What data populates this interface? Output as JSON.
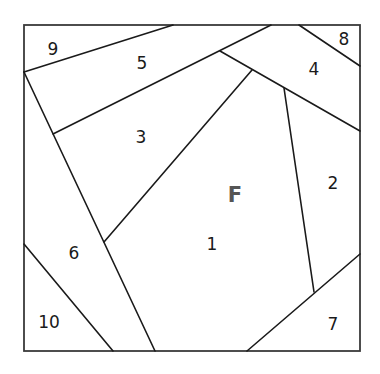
{
  "diagram": {
    "type": "foundation-paper-piecing-pattern",
    "face_label": "F",
    "colors": {
      "line": "#1a1a1a",
      "frame": "#3a3a3a",
      "face_label": "#555555",
      "background": "#ffffff"
    },
    "regions": [
      {
        "id": "1",
        "label": "1",
        "x": 212,
        "y": 251
      },
      {
        "id": "2",
        "label": "2",
        "x": 333,
        "y": 190
      },
      {
        "id": "3",
        "label": "3",
        "x": 141,
        "y": 143
      },
      {
        "id": "4",
        "label": "4",
        "x": 314,
        "y": 75
      },
      {
        "id": "5",
        "label": "5",
        "x": 142,
        "y": 71
      },
      {
        "id": "6",
        "label": "6",
        "x": 74,
        "y": 260
      },
      {
        "id": "7",
        "label": "7",
        "x": 333,
        "y": 331
      },
      {
        "id": "8",
        "label": "8",
        "x": 344,
        "y": 45
      },
      {
        "id": "9",
        "label": "9",
        "x": 53,
        "y": 50
      },
      {
        "id": "10",
        "label": "10",
        "x": 49,
        "y": 329
      }
    ],
    "face": {
      "label": "F",
      "x": 235,
      "y": 203
    }
  }
}
